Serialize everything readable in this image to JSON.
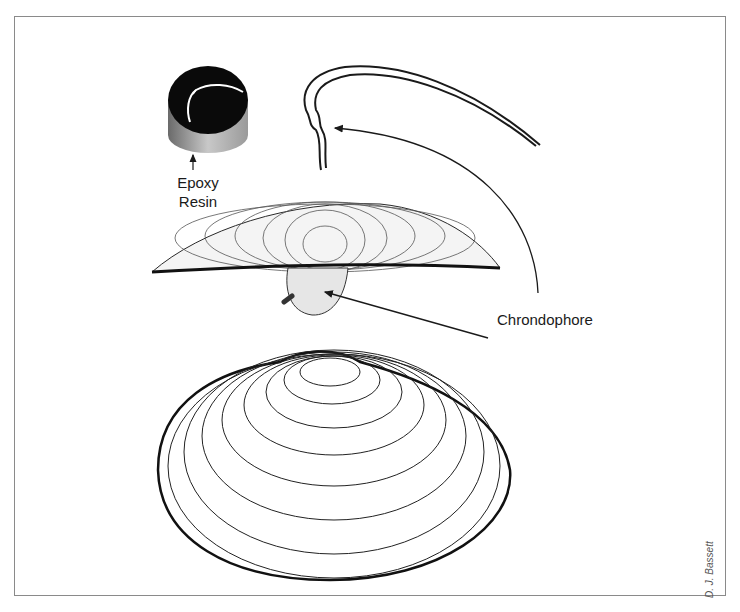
{
  "figure": {
    "labels": {
      "epoxy_line1": "Epoxy",
      "epoxy_line2": "Resin",
      "chrondophore": "Chrondophore"
    },
    "credit": "D. J. Bassett"
  },
  "colors": {
    "ink": "#1a1a1a",
    "frame": "#8a8a8a",
    "background": "#ffffff"
  }
}
